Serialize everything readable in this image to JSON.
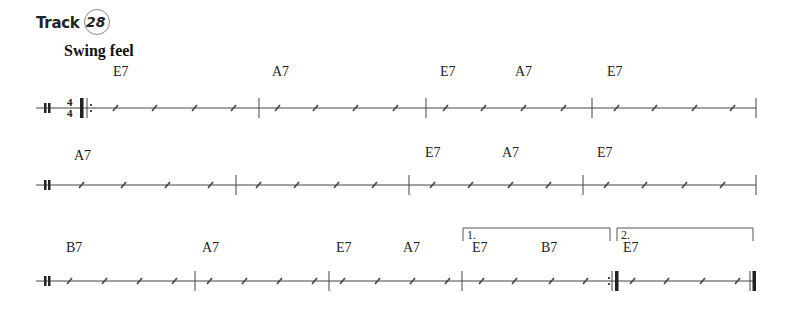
{
  "header": {
    "track_label": "Track",
    "track_number": "28",
    "style": "Swing feel"
  },
  "time_signature": {
    "top": "4",
    "bottom": "4"
  },
  "systems": [
    {
      "chords": [
        {
          "name": "E7",
          "x": 113,
          "y": 64
        },
        {
          "name": "A7",
          "x": 272,
          "y": 64
        },
        {
          "name": "E7",
          "x": 440,
          "y": 64
        },
        {
          "name": "A7",
          "x": 515,
          "y": 64
        },
        {
          "name": "E7",
          "x": 607,
          "y": 64
        }
      ]
    },
    {
      "chords": [
        {
          "name": "A7",
          "x": 74,
          "y": 148
        },
        {
          "name": "E7",
          "x": 425,
          "y": 145
        },
        {
          "name": "A7",
          "x": 502,
          "y": 145
        },
        {
          "name": "E7",
          "x": 597,
          "y": 145
        }
      ]
    },
    {
      "chords": [
        {
          "name": "B7",
          "x": 66,
          "y": 240
        },
        {
          "name": "A7",
          "x": 202,
          "y": 240
        },
        {
          "name": "E7",
          "x": 336,
          "y": 240
        },
        {
          "name": "A7",
          "x": 403,
          "y": 240
        },
        {
          "name": "E7",
          "x": 472,
          "y": 240
        },
        {
          "name": "B7",
          "x": 541,
          "y": 240
        },
        {
          "name": "E7",
          "x": 623,
          "y": 240
        }
      ],
      "endings": [
        {
          "label": "1.",
          "x": 467,
          "y": 228
        },
        {
          "label": "2.",
          "x": 621,
          "y": 228
        }
      ]
    }
  ]
}
